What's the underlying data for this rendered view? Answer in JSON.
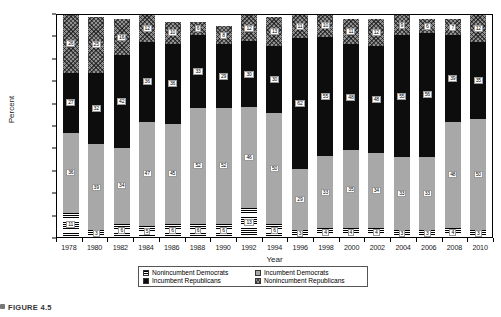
{
  "chart_data": {
    "type": "bar",
    "stacked": true,
    "stack_mode": "percent",
    "title": "",
    "xlabel": "Year",
    "ylabel": "Percent",
    "ylim": [
      0,
      100
    ],
    "yticks": [
      "0%",
      "10%",
      "20%",
      "30%",
      "40%",
      "50%",
      "60%",
      "70%",
      "80%",
      "90%",
      "100%"
    ],
    "grid": false,
    "legend_position": "bottom",
    "categories": [
      "1978",
      "1980",
      "1982",
      "1984",
      "1986",
      "1988",
      "1990",
      "1992",
      "1994",
      "1996",
      "1998",
      "2000",
      "2002",
      "2004",
      "2006",
      "2008",
      "2010"
    ],
    "series": [
      {
        "name": "Nonincumbent Democrats",
        "pattern": "horizontal-lines",
        "values": [
          11,
          3,
          6,
          5,
          6,
          6,
          6,
          13,
          6,
          3,
          4,
          4,
          4,
          3,
          3,
          4,
          3
        ]
      },
      {
        "name": "Incumbent Democrats",
        "pattern": "light-gray",
        "values": [
          36,
          39,
          34,
          47,
          45,
          52,
          52,
          46,
          50,
          29,
          33,
          35,
          34,
          33,
          33,
          48,
          50
        ]
      },
      {
        "name": "Incumbent Republicans",
        "pattern": "solid-black",
        "values": [
          27,
          32,
          42,
          36,
          36,
          33,
          29,
          30,
          30,
          62,
          55,
          48,
          48,
          55,
          56,
          39,
          35
        ]
      },
      {
        "name": "Nonincumbent Republicans",
        "pattern": "checkered-gray",
        "values": [
          26,
          25,
          16,
          12,
          10,
          6,
          8,
          12,
          13,
          11,
          10,
          11,
          12,
          9,
          6,
          7,
          12
        ]
      }
    ]
  },
  "legend": {
    "items": [
      {
        "label": "Nonincumbent Democrats",
        "swatch": "horizontal-lines"
      },
      {
        "label": "Incumbent Democrats",
        "swatch": "light-gray"
      },
      {
        "label": "Incumbent Republicans",
        "swatch": "solid-black"
      },
      {
        "label": "Nonincumbent Republicans",
        "swatch": "checkered-gray"
      }
    ]
  },
  "caption": {
    "text": "FIGURE 4.5"
  },
  "colors": {
    "incumbent_democrats": "#a8a8a8",
    "incumbent_republicans": "#0d0d0d",
    "nonincumbent_republicans": "#8f8f8f",
    "axis": "#000000"
  }
}
